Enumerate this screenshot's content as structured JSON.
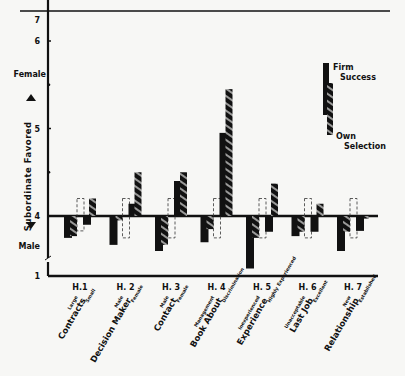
{
  "chart_data": {
    "type": "bar",
    "title": "",
    "ylabel": "Subordinate Favored",
    "y_top_label": "Female",
    "y_bottom_label": "Male",
    "ylim": [
      1,
      7
    ],
    "baseline": 4,
    "yticks": [
      1,
      4,
      5,
      6,
      7
    ],
    "y_axis_break": true,
    "legend": {
      "position": "top-right",
      "entries": [
        {
          "name": "Firm Success",
          "style": "solid",
          "line1": "Firm",
          "line2": "Success"
        },
        {
          "name": "Own Selection",
          "style": "hatched",
          "line1": "Own",
          "line2": "Selection"
        }
      ]
    },
    "categories": [
      {
        "id": "H.1",
        "name": "Contracts",
        "left": "Large",
        "right": "Small"
      },
      {
        "id": "H. 2",
        "name": "Decision Maker",
        "left": "Male",
        "right": "Female"
      },
      {
        "id": "H. 3",
        "name": "Contact",
        "left": "Male",
        "right": "Female"
      },
      {
        "id": "H. 4",
        "name": "Book About",
        "left": "Management",
        "right": "Discrimination"
      },
      {
        "id": "H. 5",
        "name": "Experience",
        "left": "Inexperienced",
        "right": "Highly Experienced"
      },
      {
        "id": "H. 6",
        "name": "Last Job",
        "left": "Unacceptable",
        "right": "Excellent"
      },
      {
        "id": "H. 7",
        "name": "Relationship",
        "left": "New",
        "right": "Established"
      }
    ],
    "series": [
      {
        "name": "Firm Success (left condition)",
        "values": [
          3.75,
          3.67,
          3.6,
          3.7,
          3.4,
          3.77,
          3.6
        ]
      },
      {
        "name": "Own Selection (left condition)",
        "values": [
          3.77,
          3.95,
          3.67,
          3.85,
          3.75,
          3.82,
          3.82
        ]
      },
      {
        "name": "Firm Success (right condition)",
        "values": [
          3.9,
          4.14,
          4.4,
          4.95,
          3.82,
          3.82,
          3.83
        ]
      },
      {
        "name": "Own Selection (right condition)",
        "values": [
          4.2,
          4.5,
          4.5,
          5.45,
          4.37,
          4.14,
          3.97
        ]
      }
    ],
    "reference_boxes": [
      {
        "hypothesis": "H.1",
        "top": 4.2,
        "bottom": 3.83
      },
      {
        "hypothesis": "H. 2",
        "top": 4.2,
        "bottom": 3.75
      },
      {
        "hypothesis": "H. 3",
        "top": 4.2,
        "bottom": 3.75
      },
      {
        "hypothesis": "H. 4",
        "top": 4.2,
        "bottom": 3.75
      },
      {
        "hypothesis": "H. 5",
        "top": 4.2,
        "bottom": 3.75
      },
      {
        "hypothesis": "H. 6",
        "top": 4.2,
        "bottom": 3.75
      },
      {
        "hypothesis": "H. 7",
        "top": 4.2,
        "bottom": 3.75
      }
    ]
  }
}
